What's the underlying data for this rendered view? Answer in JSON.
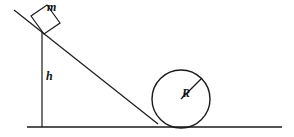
{
  "figure": {
    "kind": "physics-free-body-diagram",
    "background_color": "#ffffff",
    "stroke_color": "#1a1a1a"
  },
  "labels": {
    "mass": "m",
    "height": "h",
    "radius": "R"
  },
  "geometry": {
    "ground_line": {
      "x1": 27,
      "y1": 127,
      "x2": 282,
      "y2": 127,
      "stroke_width": 1.6
    },
    "incline_line": {
      "x1": 14,
      "y1": 10,
      "x2": 158,
      "y2": 124,
      "stroke_width": 1.2
    },
    "height_line": {
      "x1": 42,
      "y1": 32,
      "x2": 42,
      "y2": 127,
      "stroke_width": 1.2
    },
    "block": {
      "points": "31,16 47,5 60,23 44,34",
      "stroke_width": 1.2
    },
    "circle": {
      "cx": 181,
      "cy": 99,
      "r": 29,
      "stroke_width": 1.4
    },
    "radius_line": {
      "x1": 181,
      "y1": 99,
      "x2": 202,
      "y2": 78,
      "stroke_width": 1.2
    }
  }
}
